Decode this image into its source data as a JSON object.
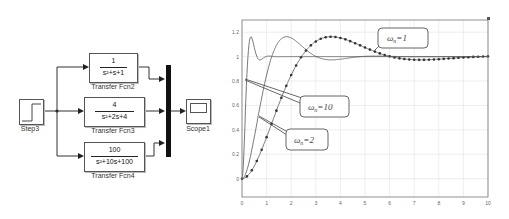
{
  "diagram": {
    "step_block": {
      "label": "Step3"
    },
    "transfer_functions": [
      {
        "label": "Transfer Fcn2",
        "numerator": "1",
        "denominator": "s²+s+1"
      },
      {
        "label": "Transfer Fcn3",
        "numerator": "4",
        "denominator": "s²+2s+4"
      },
      {
        "label": "Transfer Fcn4",
        "numerator": "100",
        "denominator": "s²+10s+100"
      }
    ],
    "mux_block": {
      "label": ""
    },
    "scope_block": {
      "label": "Scope1"
    }
  },
  "chart_data": {
    "type": "line",
    "title": "",
    "xlabel": "",
    "ylabel": "",
    "xlim": [
      0,
      10
    ],
    "ylim": [
      -0.15,
      1.3
    ],
    "xticks": [
      "0",
      "1",
      "2",
      "3",
      "4",
      "5",
      "6",
      "7",
      "8",
      "9",
      "10"
    ],
    "yticks": [
      "0",
      "0.2",
      "0.4",
      "0.6",
      "0.8",
      "1",
      "1.2"
    ],
    "grid": true,
    "series": [
      {
        "name": "ωn=1",
        "wn": 1,
        "zeta": 0.5,
        "style": "line-with-markers"
      },
      {
        "name": "ωn=2",
        "wn": 2,
        "zeta": 0.5,
        "style": "line"
      },
      {
        "name": "ωn=10",
        "wn": 10,
        "zeta": 0.5,
        "style": "line"
      }
    ],
    "annotations": [
      {
        "text": "ωn=1",
        "points_to": "ωn=1 curve near x=5.2"
      },
      {
        "text": "ωn=10",
        "points_to": "ωn=10 curve near x=0.1"
      },
      {
        "text": "ωn=2",
        "points_to": "ωn=2 curve near x=0.6"
      }
    ],
    "callouts": {
      "w1": {
        "symbol": "ω",
        "sub": "n",
        "value": "=1"
      },
      "w10": {
        "symbol": "ω",
        "sub": "n",
        "value": "=10"
      },
      "w2": {
        "symbol": "ω",
        "sub": "n",
        "value": "=2"
      }
    }
  }
}
